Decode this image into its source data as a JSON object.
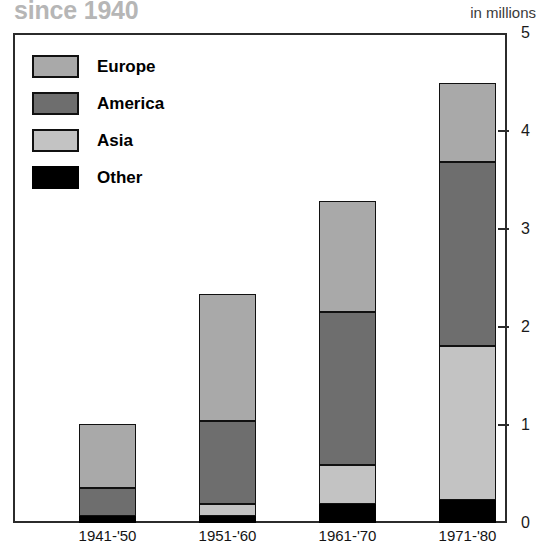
{
  "header": {
    "title": "since 1940",
    "units_label": "in millions"
  },
  "legend": {
    "items": [
      {
        "label": "Europe",
        "key": "europe",
        "color": "#a9a9a9"
      },
      {
        "label": "America",
        "key": "america",
        "color": "#6e6e6e"
      },
      {
        "label": "Asia",
        "key": "asia",
        "color": "#c3c3c3"
      },
      {
        "label": "Other",
        "key": "other",
        "color": "#000000"
      }
    ]
  },
  "axis": {
    "y_ticks": [
      "0",
      "1",
      "2",
      "3",
      "4",
      "5"
    ]
  },
  "chart_data": {
    "type": "bar",
    "stacked": true,
    "title": "since 1940",
    "xlabel": "",
    "ylabel": "in millions",
    "ylim": [
      0,
      5
    ],
    "ytick_values": [
      0,
      1,
      2,
      3,
      4,
      5
    ],
    "grid": false,
    "legend_position": "inside-top-left",
    "categories": [
      "1941-'50",
      "1951-'60",
      "1961-'70",
      "1971-'80"
    ],
    "stack_order_bottom_to_top": [
      "Other",
      "Asia",
      "America",
      "Europe"
    ],
    "series": [
      {
        "name": "Europe",
        "color": "#a9a9a9",
        "values": [
          0.65,
          1.3,
          1.14,
          0.81
        ]
      },
      {
        "name": "America",
        "color": "#6e6e6e",
        "values": [
          0.29,
          0.85,
          1.56,
          1.87
        ]
      },
      {
        "name": "Asia",
        "color": "#c3c3c3",
        "values": [
          0.0,
          0.12,
          0.4,
          1.58
        ]
      },
      {
        "name": "Other",
        "color": "#000000",
        "values": [
          0.07,
          0.07,
          0.19,
          0.23
        ]
      }
    ],
    "totals": [
      1.01,
      2.34,
      3.29,
      4.49
    ]
  }
}
